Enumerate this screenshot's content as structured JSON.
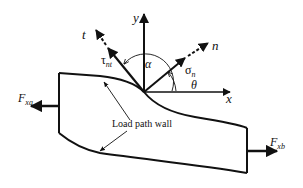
{
  "diagram": {
    "axes": {
      "x_label": "x",
      "y_label": "y",
      "n_label": "n",
      "t_label": "t"
    },
    "angles": {
      "alpha": "α",
      "theta": "θ"
    },
    "stresses": {
      "normal_base": "σ",
      "normal_sub": "n",
      "shear_base": "τ",
      "shear_sub": "nt"
    },
    "forces": {
      "left_base": "F",
      "left_sub": "xa",
      "right_base": "F",
      "right_sub": "xb"
    },
    "annotation": "Load path wall",
    "colors": {
      "stroke": "#111111",
      "background": "#ffffff"
    }
  }
}
